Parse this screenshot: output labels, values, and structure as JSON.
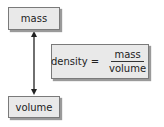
{
  "diagram": {
    "nodes": {
      "mass": {
        "label": "mass"
      },
      "volume": {
        "label": "volume"
      }
    },
    "formula": {
      "lhs": "density",
      "operator": "=",
      "numerator": "mass",
      "denominator": "volume"
    },
    "edges": [
      {
        "from": "mass",
        "to": "volume",
        "type": "double-arrow"
      }
    ]
  }
}
